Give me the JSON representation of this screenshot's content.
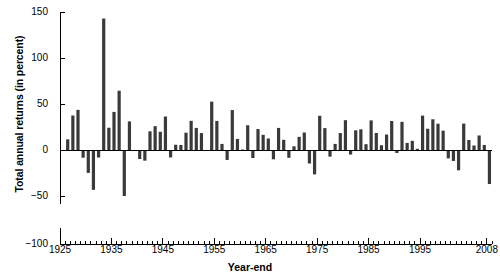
{
  "chart_data": {
    "type": "bar",
    "title": "",
    "xlabel": "Year-end",
    "ylabel": "Total annual returns (in percent)",
    "ylim": [
      -100,
      150
    ],
    "xlim": [
      1925,
      2009
    ],
    "grid": false,
    "legend": "none",
    "y_ticks": [
      150,
      100,
      50,
      0,
      -50,
      -100
    ],
    "y_tick_labels": [
      "150",
      "100",
      "50",
      "0",
      "-50",
      "-100"
    ],
    "y_axis_break": {
      "between": [
        -55,
        -95
      ],
      "note": "axis broken below -50"
    },
    "x_ticks": [
      1925,
      1935,
      1945,
      1955,
      1965,
      1975,
      1985,
      1995,
      2008
    ],
    "x_tick_labels": [
      "1925",
      "1935",
      "1945",
      "1955",
      "1965",
      "1975",
      "1985",
      "1995",
      "2008"
    ],
    "x_minor_tick_interval": 1,
    "bar_color": "#3a3a3a",
    "categories": [
      1926,
      1927,
      1928,
      1929,
      1930,
      1931,
      1932,
      1933,
      1934,
      1935,
      1936,
      1937,
      1938,
      1939,
      1940,
      1941,
      1942,
      1943,
      1944,
      1945,
      1946,
      1947,
      1948,
      1949,
      1950,
      1951,
      1952,
      1953,
      1954,
      1955,
      1956,
      1957,
      1958,
      1959,
      1960,
      1961,
      1962,
      1963,
      1964,
      1965,
      1966,
      1967,
      1968,
      1969,
      1970,
      1971,
      1972,
      1973,
      1974,
      1975,
      1976,
      1977,
      1978,
      1979,
      1980,
      1981,
      1982,
      1983,
      1984,
      1985,
      1986,
      1987,
      1988,
      1989,
      1990,
      1991,
      1992,
      1993,
      1994,
      1995,
      1996,
      1997,
      1998,
      1999,
      2000,
      2001,
      2002,
      2003,
      2004,
      2005,
      2006,
      2007,
      2008
    ],
    "values": [
      11.6,
      37.5,
      43.6,
      -8.4,
      -24.9,
      -43.3,
      -8.2,
      142.9,
      24.2,
      41.4,
      64.4,
      -50.0,
      31.1,
      -0.4,
      -9.8,
      -11.6,
      20.3,
      25.9,
      19.8,
      36.4,
      -8.1,
      5.7,
      5.5,
      18.8,
      31.7,
      24.0,
      18.4,
      -1.0,
      52.6,
      31.6,
      6.6,
      -10.8,
      43.4,
      12.0,
      0.5,
      26.9,
      -8.7,
      22.8,
      16.5,
      12.5,
      -10.1,
      24.0,
      11.1,
      -8.5,
      4.0,
      14.3,
      19.0,
      -14.7,
      -26.5,
      37.2,
      23.8,
      -7.2,
      6.6,
      18.4,
      32.4,
      -4.9,
      21.4,
      22.5,
      6.3,
      32.2,
      18.5,
      5.2,
      16.8,
      31.5,
      -3.2,
      30.6,
      7.7,
      10.0,
      1.3,
      37.4,
      23.1,
      33.4,
      28.6,
      21.0,
      -9.1,
      -11.9,
      -22.1,
      28.7,
      10.9,
      4.9,
      15.8,
      5.5,
      -37.0
    ],
    "max_value": 142.9,
    "min_value": -50.0,
    "n_observations": 83
  }
}
